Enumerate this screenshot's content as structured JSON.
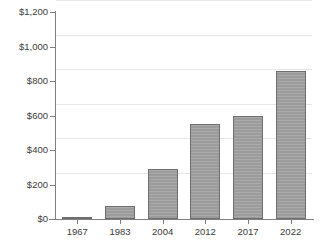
{
  "chart_data": {
    "type": "bar",
    "title": "",
    "subtitle": "",
    "xlabel": "",
    "ylabel": "",
    "categories": [
      "1967",
      "1983",
      "2004",
      "2012",
      "2017",
      "2022"
    ],
    "values": [
      12,
      75,
      290,
      550,
      600,
      860
    ],
    "ylim": [
      0,
      1200
    ],
    "yticks": [
      0,
      200,
      400,
      600,
      800,
      1000,
      1200
    ],
    "ytick_labels": [
      "$0",
      "$200",
      "$400",
      "$600",
      "$800",
      "$1,000",
      "$1,200"
    ],
    "xtick_labels": [
      "1967",
      "1983",
      "2004",
      "2012",
      "2017",
      "2022"
    ],
    "grid": true,
    "grid_axis": "y",
    "legend": false,
    "legend_position": "none",
    "annotations": [],
    "series": [
      {
        "name": "",
        "values": [
          12,
          75,
          290,
          550,
          600,
          860
        ]
      }
    ],
    "value_prefix": "$",
    "colors": {
      "bar_fill": "#9b9b9b",
      "bar_border": "#6f6f6f",
      "gridline": "#e6e6e6",
      "axis": "#808080",
      "tick_label": "#3a3a3a",
      "background": "#ffffff"
    }
  }
}
